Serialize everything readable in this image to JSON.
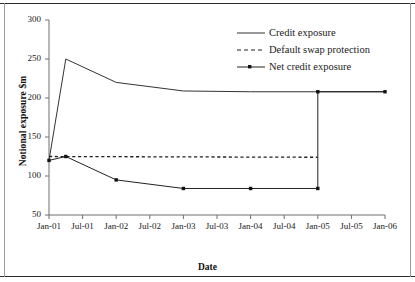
{
  "chart_data": {
    "type": "line",
    "title": "",
    "xlabel": "Date",
    "ylabel": "Notional exposure $m",
    "xticks": [
      "Jan-01",
      "Jul-01",
      "Jan-02",
      "Jul-02",
      "Jan-03",
      "Jul-03",
      "Jan-04",
      "Jul-04",
      "Jan-05",
      "Jul-05",
      "Jan-06"
    ],
    "yticks": [
      50,
      100,
      150,
      200,
      250,
      300
    ],
    "ylim": [
      50,
      300
    ],
    "xlim": [
      "Jan-01",
      "Jan-06"
    ],
    "grid": false,
    "legend_position": "top-right",
    "series": [
      {
        "name": "Credit exposure",
        "style": "solid",
        "marker": "none",
        "color": "#333333",
        "points": [
          {
            "x": "Jan-01",
            "y": 120
          },
          {
            "x": "Apr-01",
            "y": 250
          },
          {
            "x": "Jan-02",
            "y": 220
          },
          {
            "x": "Jan-03",
            "y": 209
          },
          {
            "x": "Jan-04",
            "y": 208
          },
          {
            "x": "Jan-05",
            "y": 208
          },
          {
            "x": "Jan-06",
            "y": 208
          }
        ]
      },
      {
        "name": "Default swap protection",
        "style": "dashed",
        "marker": "none",
        "color": "#222222",
        "points": [
          {
            "x": "Jan-01",
            "y": 125
          },
          {
            "x": "Jan-05",
            "y": 124
          }
        ]
      },
      {
        "name": "Net credit exposure",
        "style": "solid",
        "marker": "square",
        "color": "#222222",
        "points": [
          {
            "x": "Jan-01",
            "y": 120
          },
          {
            "x": "Apr-01",
            "y": 125
          },
          {
            "x": "Jan-02",
            "y": 95
          },
          {
            "x": "Jan-03",
            "y": 84
          },
          {
            "x": "Jan-04",
            "y": 84
          },
          {
            "x": "Jan-05",
            "y": 84
          },
          {
            "x": "Jan-05",
            "y": 208
          },
          {
            "x": "Jan-06",
            "y": 208
          }
        ]
      }
    ]
  },
  "legend": {
    "items": [
      {
        "label": "Credit exposure",
        "key": "solid-line-key"
      },
      {
        "label": "Default swap protection",
        "key": "dashed-line-key"
      },
      {
        "label": "Net credit exposure",
        "key": "marker-line-key"
      }
    ]
  }
}
